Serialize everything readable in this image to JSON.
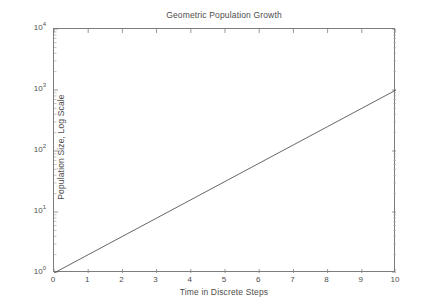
{
  "chart_data": {
    "type": "line",
    "title": "Geometric Population Growth",
    "xlabel": "Time in Discrete Steps",
    "ylabel": "Population Size, Log Scale",
    "yscale": "log",
    "xlim": [
      0,
      10
    ],
    "ylim": [
      1,
      10000
    ],
    "grid": false,
    "legend": null,
    "line_color": "#555555",
    "x": [
      0,
      1,
      2,
      3,
      4,
      5,
      6,
      7,
      8,
      9,
      10
    ],
    "values": [
      1,
      1.995,
      3.981,
      7.943,
      15.849,
      31.623,
      63.096,
      125.893,
      251.189,
      501.187,
      1000
    ],
    "series": [
      {
        "name": "Population",
        "x": [
          0,
          1,
          2,
          3,
          4,
          5,
          6,
          7,
          8,
          9,
          10
        ],
        "values": [
          1,
          1.995,
          3.981,
          7.943,
          15.849,
          31.623,
          63.096,
          125.893,
          251.189,
          501.187,
          1000
        ]
      }
    ],
    "xticks": [
      0,
      1,
      2,
      3,
      4,
      5,
      6,
      7,
      8,
      9,
      10
    ],
    "xtick_labels": [
      "0",
      "1",
      "2",
      "3",
      "4",
      "5",
      "6",
      "7",
      "8",
      "9",
      "10"
    ],
    "ytick_values": [
      1,
      10,
      100,
      1000,
      10000
    ],
    "ytick_labels": [
      {
        "base": "10",
        "exp": "0"
      },
      {
        "base": "10",
        "exp": "1"
      },
      {
        "base": "10",
        "exp": "2"
      },
      {
        "base": "10",
        "exp": "3"
      },
      {
        "base": "10",
        "exp": "4"
      }
    ]
  },
  "style": {
    "background": "#ffffff",
    "axis_color": "#7d7d7d",
    "text_color": "#4d4d4d",
    "line_color": "#555555"
  }
}
